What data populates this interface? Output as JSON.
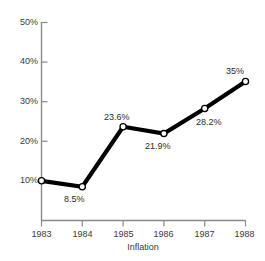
{
  "chart_data": {
    "type": "line",
    "title": "",
    "xlabel": "Inflation",
    "ylabel": "",
    "categories": [
      "1983",
      "1984",
      "1985",
      "1986",
      "1987",
      "1988"
    ],
    "values": [
      10,
      8.5,
      23.6,
      21.9,
      28.2,
      35
    ],
    "point_labels": [
      "",
      "8.5%",
      "23.6%",
      "21.9%",
      "28.2%",
      "35%"
    ],
    "ylim": [
      0,
      50
    ],
    "ytick_values": [
      10,
      20,
      30,
      40,
      50
    ],
    "ytick_labels": [
      "10%",
      "20%",
      "30%",
      "40%",
      "50%"
    ],
    "grid": false,
    "legend": false,
    "line_color": "#000000",
    "marker_face_color": "#ffffff",
    "marker_edge_color": "#000000",
    "axis_color": "#8a8a8a",
    "text_color": "#3a3a3a",
    "background_color": "#ffffff"
  },
  "axis": {
    "x_title": "Inflation"
  },
  "ticks": {
    "y": [
      {
        "label": "50%"
      },
      {
        "label": "40%"
      },
      {
        "label": "30%"
      },
      {
        "label": "20%"
      },
      {
        "label": "10%"
      }
    ],
    "x": [
      {
        "label": "1983"
      },
      {
        "label": "1984"
      },
      {
        "label": "1985"
      },
      {
        "label": "1986"
      },
      {
        "label": "1987"
      },
      {
        "label": "1988"
      }
    ]
  },
  "labels": {
    "p1984": "8.5%",
    "p1985": "23.6%",
    "p1986": "21.9%",
    "p1987": "28.2%",
    "p1988": "35%"
  }
}
